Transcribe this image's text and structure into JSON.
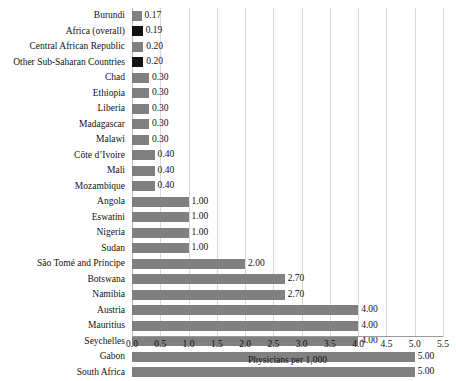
{
  "chart_data": {
    "type": "bar",
    "orientation": "horizontal",
    "title": "",
    "xlabel": "Physicians per 1,000",
    "ylabel": "",
    "xlim": [
      0.0,
      5.5
    ],
    "xticks": [
      "0.0",
      "0.5",
      "1.0",
      "1.5",
      "2.0",
      "2.5",
      "3.0",
      "3.5",
      "4.0",
      "4.5",
      "5.0",
      "5.5"
    ],
    "xtick_values": [
      0.0,
      0.5,
      1.0,
      1.5,
      2.0,
      2.5,
      3.0,
      3.5,
      4.0,
      4.5,
      5.0,
      5.5
    ],
    "grid": "vertical",
    "legend": "none",
    "bar_color": "#808080",
    "highlight_color": "#121212",
    "categories": [
      "Burundi",
      "Africa (overall)",
      "Central African Republic",
      "Other Sub-Saharan Countries",
      "Chad",
      "Ethiopia",
      "Liberia",
      "Madagascar",
      "Malawi",
      "Côte d’Ivoire",
      "Mali",
      "Mozambique",
      "Angola",
      "Eswatini",
      "Nigeria",
      "Sudan",
      "São Tomé and Príncipe",
      "Botswana",
      "Namibia",
      "Austria",
      "Mauritius",
      "Seychelles",
      "Gabon",
      "South Africa"
    ],
    "values": [
      0.17,
      0.19,
      0.2,
      0.2,
      0.3,
      0.3,
      0.3,
      0.3,
      0.3,
      0.4,
      0.4,
      0.4,
      1.0,
      1.0,
      1.0,
      1.0,
      2.0,
      2.7,
      2.7,
      4.0,
      4.0,
      4.0,
      5.0,
      5.0
    ],
    "value_labels": [
      "0.17",
      "0.19",
      "0.20",
      "0.20",
      "0.30",
      "0.30",
      "0.30",
      "0.30",
      "0.30",
      "0.40",
      "0.40",
      "0.40",
      "1.00",
      "1.00",
      "1.00",
      "1.00",
      "2.00",
      "2.70",
      "2.70",
      "4.00",
      "4.00",
      "4.00",
      "5.00",
      "5.00"
    ],
    "highlighted": [
      false,
      true,
      false,
      true,
      false,
      false,
      false,
      false,
      false,
      false,
      false,
      false,
      false,
      false,
      false,
      false,
      false,
      false,
      false,
      false,
      false,
      false,
      false,
      false
    ]
  }
}
